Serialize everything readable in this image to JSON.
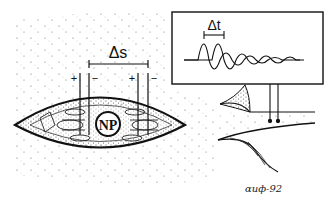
{
  "figure": {
    "type": "scientific-illustration"
  },
  "labels": {
    "distance": "Δs",
    "time": "Δt",
    "nerve_center": "NP",
    "electrode_left_plus": "+",
    "electrode_left_minus": "−",
    "electrode_right_plus": "+",
    "electrode_right_minus": "−",
    "signature": "ɑиф-92"
  },
  "colors": {
    "ink": "#111111",
    "background": "#ffffff",
    "stipple": "#555555"
  },
  "oscilloscope": {
    "traces": 2,
    "description": "two damped oscillation waveforms offset by Δt"
  }
}
